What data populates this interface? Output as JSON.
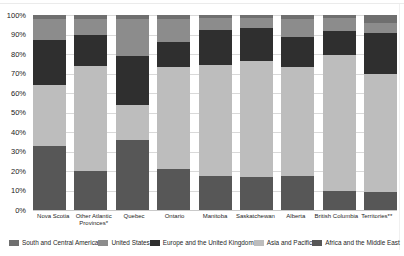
{
  "chart_data": {
    "type": "bar",
    "stacked": true,
    "percent_stacked": true,
    "title": "",
    "xlabel": "",
    "ylabel": "",
    "ylim": [
      0,
      100
    ],
    "grid": "horizontal",
    "legend_position": "bottom",
    "y_ticks": [
      "100%",
      "90%",
      "80%",
      "70%",
      "60%",
      "50%",
      "40%",
      "30%",
      "20%",
      "10%",
      "0%"
    ],
    "categories": [
      "Nova Scotia",
      "Other Atlantic Provinces*",
      "Quebec",
      "Ontario",
      "Manitoba",
      "Saskatchewan",
      "Alberta",
      "British Columbia",
      "Territories**"
    ],
    "series": [
      {
        "name": "Africa and the Middle East",
        "color": "#575757",
        "values": [
          33,
          20,
          36,
          21,
          17.5,
          17,
          17.5,
          9.5,
          9
        ]
      },
      {
        "name": "Asia and Pacific",
        "color": "#bdbdbd",
        "values": [
          31,
          54,
          18,
          52.5,
          57,
          59.5,
          56,
          70,
          61
        ]
      },
      {
        "name": "Europe and the United Kingdom",
        "color": "#2f2f2f",
        "values": [
          23,
          16,
          25,
          12.5,
          18,
          17,
          15,
          12.5,
          21
        ]
      },
      {
        "name": "United States",
        "color": "#8c8c8c",
        "values": [
          11,
          8,
          19,
          12,
          6,
          5,
          9.5,
          6.5,
          5
        ]
      },
      {
        "name": "South and Central America",
        "color": "#6f6f6f",
        "values": [
          2,
          2,
          2,
          2,
          1.5,
          1.5,
          2,
          1.5,
          4
        ]
      }
    ],
    "legend_order": [
      "South and Central America",
      "United States",
      "Europe and the United Kingdom",
      "Asia and Pacific",
      "Africa and the Middle East"
    ],
    "colors": {
      "background": "#ffffff",
      "gridline": "#d9d9d9",
      "tick_text": "#1a1a1a",
      "label_text": "#262626"
    }
  }
}
